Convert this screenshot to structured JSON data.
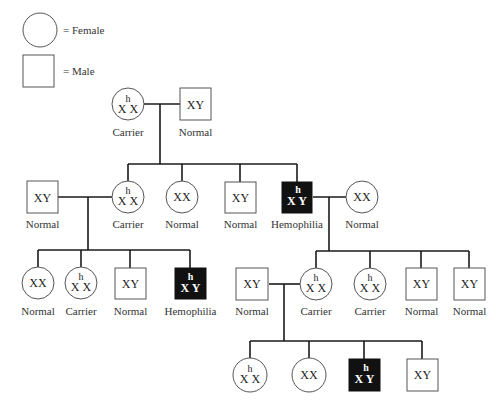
{
  "legend": {
    "female_label": "= Female",
    "male_label": "= Male"
  },
  "genotypes": {
    "XX": "XX",
    "XY": "XY",
    "X": "X",
    "Y": "Y",
    "h": "h"
  },
  "colors": {
    "affected_fill": "#111111",
    "unaffected_fill": "#ffffff",
    "line": "#1a1a1a"
  },
  "generations": [
    {
      "id": "I",
      "individuals": [
        {
          "id": "I-1",
          "sex": "female",
          "genotype": "X^h X",
          "status": "Carrier"
        },
        {
          "id": "I-2",
          "sex": "male",
          "genotype": "XY",
          "status": "Normal"
        }
      ]
    },
    {
      "id": "II",
      "individuals": [
        {
          "id": "II-spouse-1",
          "sex": "male",
          "genotype": "XY",
          "status": "Normal"
        },
        {
          "id": "II-1",
          "sex": "female",
          "genotype": "X^h X",
          "status": "Carrier"
        },
        {
          "id": "II-2",
          "sex": "female",
          "genotype": "XX",
          "status": "Normal"
        },
        {
          "id": "II-3",
          "sex": "male",
          "genotype": "XY",
          "status": "Normal"
        },
        {
          "id": "II-4",
          "sex": "male",
          "genotype": "X^h Y",
          "status": "Hemophilia"
        },
        {
          "id": "II-spouse-4",
          "sex": "female",
          "genotype": "XX",
          "status": "Normal"
        }
      ]
    },
    {
      "id": "III",
      "individuals": [
        {
          "id": "III-1",
          "sex": "female",
          "genotype": "XX",
          "status": "Normal"
        },
        {
          "id": "III-2",
          "sex": "female",
          "genotype": "X^h X",
          "status": "Carrier"
        },
        {
          "id": "III-3",
          "sex": "male",
          "genotype": "XY",
          "status": "Normal"
        },
        {
          "id": "III-4",
          "sex": "male",
          "genotype": "X^h Y",
          "status": "Hemophilia"
        },
        {
          "id": "III-spouse-5",
          "sex": "male",
          "genotype": "XY",
          "status": "Normal"
        },
        {
          "id": "III-5",
          "sex": "female",
          "genotype": "X^h X",
          "status": "Carrier"
        },
        {
          "id": "III-6",
          "sex": "female",
          "genotype": "X^h X",
          "status": "Carrier"
        },
        {
          "id": "III-7",
          "sex": "male",
          "genotype": "XY",
          "status": "Normal"
        },
        {
          "id": "III-8",
          "sex": "male",
          "genotype": "XY",
          "status": "Normal"
        }
      ]
    },
    {
      "id": "IV",
      "individuals": [
        {
          "id": "IV-1",
          "sex": "female",
          "genotype": "X^h X",
          "status": ""
        },
        {
          "id": "IV-2",
          "sex": "female",
          "genotype": "XX",
          "status": ""
        },
        {
          "id": "IV-3",
          "sex": "male",
          "genotype": "X^h Y",
          "status": ""
        },
        {
          "id": "IV-4",
          "sex": "male",
          "genotype": "XY",
          "status": ""
        }
      ]
    }
  ],
  "labels": {
    "I_1": "Carrier",
    "I_2": "Normal",
    "II_s1": "Normal",
    "II_1": "Carrier",
    "II_2": "Normal",
    "II_3": "Normal",
    "II_4": "Hemophilia",
    "II_s4": "Normal",
    "III_1": "Normal",
    "III_2": "Carrier",
    "III_3": "Normal",
    "III_4": "Hemophilia",
    "III_s5": "Normal",
    "III_5": "Carrier",
    "III_6": "Carrier",
    "III_7": "Normal",
    "III_8": "Normal"
  }
}
